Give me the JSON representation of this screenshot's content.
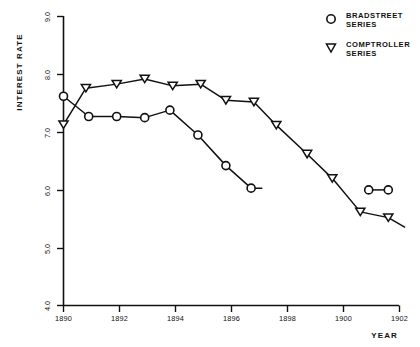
{
  "chart_data": {
    "type": "line",
    "title": "",
    "xlabel": "YEAR",
    "ylabel": "INTEREST RATE",
    "xlim": [
      1890,
      1902.8
    ],
    "ylim": [
      4.0,
      9.0
    ],
    "grid": false,
    "legend_position": "top-right",
    "x_ticks": [
      "1890",
      "1892",
      "1894",
      "1896",
      "1898",
      "1900",
      "1902"
    ],
    "x_tick_values": [
      1890,
      1892,
      1894,
      1896,
      1898,
      1900,
      1902
    ],
    "y_ticks": [
      "4.0",
      "5.0",
      "6.0",
      "7.0",
      "8.0",
      "9.0"
    ],
    "y_tick_values": [
      4.0,
      5.0,
      6.0,
      7.0,
      8.0,
      9.0
    ],
    "series": [
      {
        "name": "BRADSTREET SERIES",
        "marker": "circle",
        "x": [
          1890.0,
          1890.9,
          1891.9,
          1892.9,
          1893.8,
          1894.8,
          1895.8,
          1896.7
        ],
        "values": [
          7.62,
          7.27,
          7.27,
          7.25,
          7.38,
          6.95,
          6.42,
          6.03
        ],
        "segments": [
          {
            "x": [
              1890.0,
              1890.9,
              1891.9,
              1892.9,
              1893.8,
              1894.8,
              1895.8,
              1896.7,
              1897.1
            ],
            "values": [
              7.62,
              7.27,
              7.27,
              7.25,
              7.38,
              6.95,
              6.42,
              6.03,
              6.03
            ]
          },
          {
            "x": [
              1900.9,
              1901.6
            ],
            "values": [
              6.0,
              6.0
            ]
          }
        ]
      },
      {
        "name": "COMPTROLLER SERIES",
        "marker": "triangle-down",
        "x": [
          1890.0,
          1890.8,
          1891.9,
          1892.9,
          1893.9,
          1894.9,
          1895.8,
          1896.8,
          1897.6,
          1898.7,
          1899.6,
          1900.6,
          1901.6
        ],
        "values": [
          7.13,
          7.76,
          7.83,
          7.92,
          7.8,
          7.83,
          7.55,
          7.52,
          7.12,
          6.62,
          6.2,
          5.62,
          5.52
        ],
        "segments": [
          {
            "x": [
              1890.0,
              1890.8,
              1891.9,
              1892.9,
              1893.9,
              1894.9,
              1895.8,
              1896.8,
              1897.6,
              1898.7,
              1899.6,
              1900.6,
              1901.6,
              1902.2
            ],
            "values": [
              7.13,
              7.76,
              7.83,
              7.92,
              7.8,
              7.83,
              7.55,
              7.52,
              7.12,
              6.62,
              6.2,
              5.62,
              5.52,
              5.35
            ]
          }
        ]
      }
    ]
  },
  "legend": {
    "items": [
      {
        "marker": "circle",
        "line1": "BRADSTREET",
        "line2": "SERIES"
      },
      {
        "marker": "triangle-down",
        "line1": "COMPTROLLER",
        "line2": "SERIES"
      }
    ]
  },
  "axes": {
    "y_title": "INTEREST RATE",
    "x_title": "YEAR",
    "y_tick_labels": [
      "9.0",
      "8.0",
      "7.0",
      "6.0",
      "5.0",
      "4.0"
    ],
    "x_tick_labels": [
      "1890",
      "1892",
      "1894",
      "1896",
      "1898",
      "1900",
      "1902"
    ]
  }
}
